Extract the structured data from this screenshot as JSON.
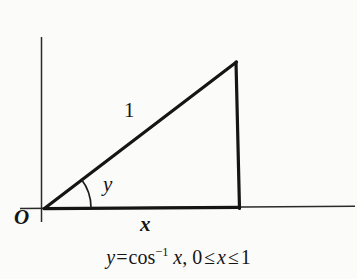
{
  "figure": {
    "type": "geometry-diagram",
    "background_color": "#fbfbfa",
    "ink_color": "#151515"
  },
  "axes": {
    "origin_label": "O",
    "y_axis": {
      "name": "vertical-axis",
      "x": 41,
      "y_top": 37,
      "y_bottom": 222,
      "stroke_width": 1.4
    },
    "x_axis": {
      "name": "horizontal-axis",
      "y": 207,
      "x_left": 20,
      "x_right": 355,
      "stroke_width": 1.4
    }
  },
  "triangle": {
    "vertices": {
      "origin": {
        "x": 45,
        "y": 208
      },
      "apex": {
        "x": 236,
        "y": 62
      },
      "foot": {
        "x": 239,
        "y": 208
      }
    },
    "stroke_width": 3.2,
    "hypotenuse_label": "1",
    "base_label": "x",
    "angle_label": "y"
  },
  "angle_arc": {
    "name": "angle-arc",
    "center": {
      "x": 45,
      "y": 208
    },
    "radius": 46,
    "start_deg": 0,
    "end_deg": 37,
    "stroke_width": 1.6
  },
  "caption": {
    "full_text": "y = cos^-1 x, 0 <= x <= 1",
    "lhs": "y",
    "equals": "=",
    "function": "cos",
    "exponent": "−1",
    "argument": "x",
    "comma": ",",
    "lower_bound": "0",
    "le_left": "≤",
    "variable": "x",
    "le_right": "≤",
    "upper_bound": "1"
  }
}
